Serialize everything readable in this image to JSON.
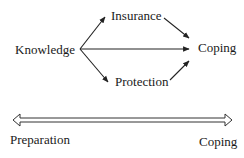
{
  "diagram": {
    "nodes": {
      "knowledge": "Knowledge",
      "insurance": "Insurance",
      "protection": "Protection",
      "coping": "Coping"
    },
    "edges": [
      {
        "from": "Knowledge",
        "to": "Insurance"
      },
      {
        "from": "Knowledge",
        "to": "Coping"
      },
      {
        "from": "Knowledge",
        "to": "Protection"
      },
      {
        "from": "Insurance",
        "to": "Coping"
      },
      {
        "from": "Protection",
        "to": "Coping"
      }
    ],
    "continuum": {
      "left_label": "Preparation",
      "right_label": "Coping",
      "arrow_style": "double-headed hollow"
    },
    "colors": {
      "line": "#222222",
      "text": "#1a1a1a",
      "background": "#ffffff"
    }
  }
}
